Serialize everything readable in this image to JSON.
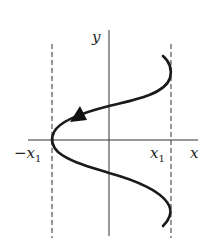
{
  "diagram": {
    "labels": {
      "y_axis": "y",
      "x_axis": "x",
      "neg_x1_main": "−x",
      "neg_x1_sub": "1",
      "x1_main": "x",
      "x1_sub": "1"
    },
    "colors": {
      "stroke": "#1a1a1a",
      "axis": "#333333",
      "dashed": "#555555"
    }
  }
}
